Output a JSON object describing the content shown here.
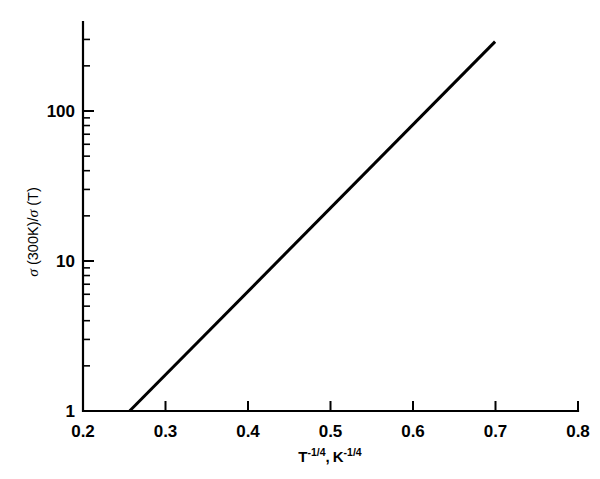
{
  "chart_data": {
    "type": "line",
    "title": "",
    "subtitle": "",
    "xlabel": "T^-1/4, K^-1/4",
    "xlabel_parts": {
      "t_base": "T",
      "t_exp": "-1/4",
      "separator": ",",
      "k_base": "K",
      "k_exp": "-1/4"
    },
    "ylabel": "σ (300K)/σ (T)",
    "ylabel_parts": {
      "sigma1": "σ",
      "num": " (300K)/",
      "sigma2": "σ",
      "den": " (T)"
    },
    "xscale": "linear",
    "yscale": "log",
    "xlim": [
      0.2,
      0.8
    ],
    "ylim": [
      1,
      300
    ],
    "grid": false,
    "legend": false,
    "legend_position": "none",
    "xticks": [
      0.2,
      0.3,
      0.4,
      0.5,
      0.6,
      0.7,
      0.8
    ],
    "xtick_labels": [
      "0.2",
      "0.3",
      "0.4",
      "0.5",
      "0.6",
      "0.7",
      "0.8"
    ],
    "yticks": [
      1,
      10,
      100
    ],
    "ytick_labels": [
      "1",
      "10",
      "100"
    ],
    "y_minor_ticks": [
      2,
      3,
      4,
      5,
      6,
      7,
      8,
      9,
      20,
      30,
      40,
      50,
      60,
      70,
      80,
      90,
      200,
      300
    ],
    "series": [
      {
        "name": "variable-range-hopping fit",
        "style": "solid",
        "color": "#000000",
        "x": [
          0.2565,
          0.6995
        ],
        "y": [
          1.0,
          290.0
        ]
      }
    ],
    "annotations": [],
    "colors": {
      "background": "#ffffff",
      "axis": "#000000",
      "line": "#000000",
      "text": "#000000"
    }
  }
}
